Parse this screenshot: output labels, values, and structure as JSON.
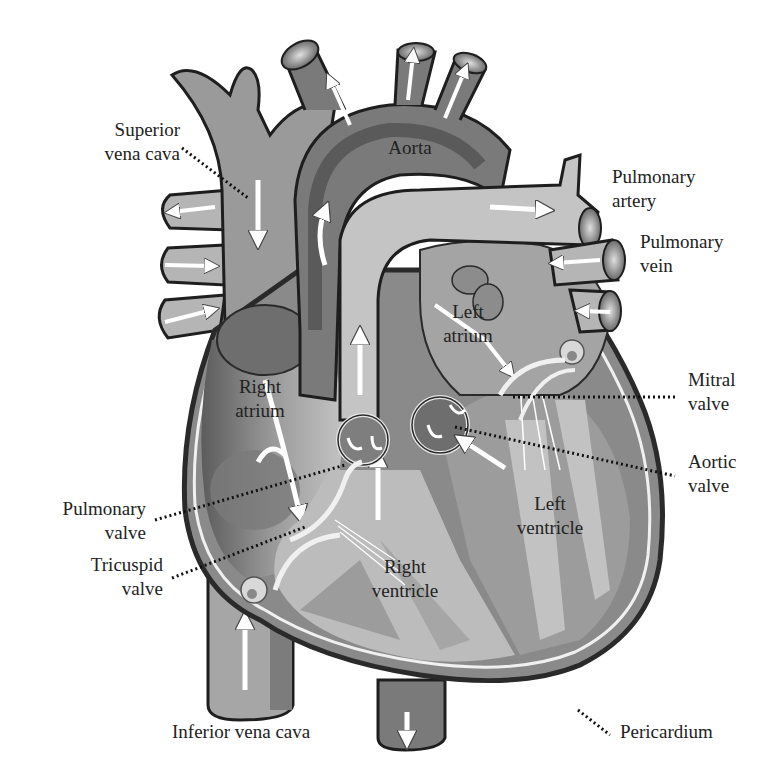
{
  "diagram": {
    "colors": {
      "outline": "#1e1e1e",
      "dark_chamber": "#6e6e6e",
      "mid": "#8c8c8c",
      "light": "#b8b8b8",
      "lighter": "#d2d2d2",
      "arrow": "#ffffff",
      "background": "#ffffff"
    },
    "labels": {
      "superior_vena_cava": {
        "line1": "Superior",
        "line2": "vena cava"
      },
      "aorta": {
        "line1": "Aorta"
      },
      "pulmonary_artery": {
        "line1": "Pulmonary",
        "line2": "artery"
      },
      "pulmonary_vein": {
        "line1": "Pulmonary",
        "line2": "vein"
      },
      "left_atrium": {
        "line1": "Left",
        "line2": "atrium"
      },
      "right_atrium": {
        "line1": "Right",
        "line2": "atrium"
      },
      "mitral_valve": {
        "line1": "Mitral",
        "line2": "valve"
      },
      "aortic_valve": {
        "line1": "Aortic",
        "line2": "valve"
      },
      "pulmonary_valve": {
        "line1": "Pulmonary",
        "line2": "valve"
      },
      "tricuspid_valve": {
        "line1": "Tricuspid",
        "line2": "valve"
      },
      "left_ventricle": {
        "line1": "Left",
        "line2": "ventricle"
      },
      "right_ventricle": {
        "line1": "Right",
        "line2": "ventricle"
      },
      "inferior_vena_cava": {
        "line1": "Inferior vena cava"
      },
      "pericardium": {
        "line1": "Pericardium"
      }
    }
  }
}
